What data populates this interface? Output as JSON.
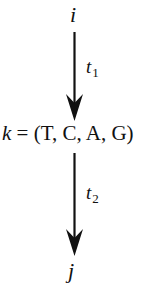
{
  "diagram": {
    "nodes": [
      {
        "id": "i",
        "label": "i"
      },
      {
        "id": "k",
        "var": "k",
        "equals": "=",
        "value": "(T, C, A, G)"
      },
      {
        "id": "j",
        "label": "j"
      }
    ],
    "edges": [
      {
        "from": "i",
        "to": "k",
        "label_base": "t",
        "label_sub": "1"
      },
      {
        "from": "k",
        "to": "j",
        "label_base": "t",
        "label_sub": "2"
      }
    ],
    "colors": {
      "stroke": "#111111",
      "background": "#ffffff"
    }
  }
}
